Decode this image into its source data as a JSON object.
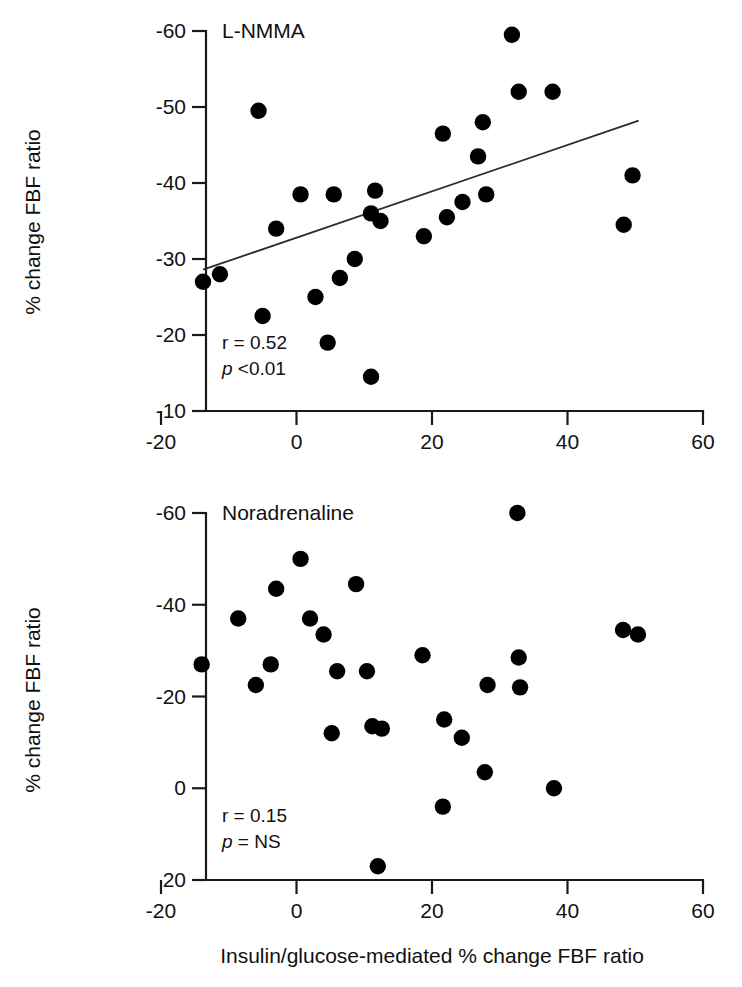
{
  "figure": {
    "x_axis_title": "Insulin/glucose-mediated % change FBF ratio",
    "y_axis_title": "% change FBF ratio"
  },
  "chart_data": [
    {
      "type": "scatter",
      "panel_id": "top",
      "title": "L-NMMA",
      "xlabel": "",
      "ylabel": "% change FBF ratio",
      "xlim": [
        -20,
        60
      ],
      "ylim": [
        -10,
        -60
      ],
      "y_axis_inverted": true,
      "xticks": [
        -20,
        0,
        20,
        40,
        60
      ],
      "yticks": [
        -60,
        -50,
        -40,
        -30,
        -20,
        -10
      ],
      "grid": false,
      "legend": "none",
      "annotations": {
        "r_label": "r = 0.52",
        "p_label": "p <0.01",
        "r_value": 0.52,
        "p_value": "<0.01"
      },
      "fit_line": {
        "visible": true,
        "x_start": -13.8,
        "y_start": -28.6,
        "x_end": 50.5,
        "y_end": -48.2
      },
      "points": [
        {
          "x": -13.8,
          "y": -27.0
        },
        {
          "x": -11.3,
          "y": -28.0
        },
        {
          "x": -5.6,
          "y": -49.5
        },
        {
          "x": -5.0,
          "y": -22.5
        },
        {
          "x": -3.0,
          "y": -34.0
        },
        {
          "x": 0.6,
          "y": -38.5
        },
        {
          "x": 2.8,
          "y": -25.0
        },
        {
          "x": 4.6,
          "y": -19.0
        },
        {
          "x": 5.5,
          "y": -38.5
        },
        {
          "x": 6.4,
          "y": -27.5
        },
        {
          "x": 8.6,
          "y": -30.0
        },
        {
          "x": 11.0,
          "y": -14.5
        },
        {
          "x": 11.0,
          "y": -36.0
        },
        {
          "x": 11.6,
          "y": -39.0
        },
        {
          "x": 12.4,
          "y": -35.0
        },
        {
          "x": 18.8,
          "y": -33.0
        },
        {
          "x": 21.6,
          "y": -46.5
        },
        {
          "x": 22.2,
          "y": -35.5
        },
        {
          "x": 24.5,
          "y": -37.5
        },
        {
          "x": 26.8,
          "y": -43.5
        },
        {
          "x": 27.5,
          "y": -48.0
        },
        {
          "x": 28.0,
          "y": -38.5
        },
        {
          "x": 31.8,
          "y": -59.5
        },
        {
          "x": 32.8,
          "y": -52.0
        },
        {
          "x": 37.8,
          "y": -52.0
        },
        {
          "x": 48.3,
          "y": -34.5
        },
        {
          "x": 49.6,
          "y": -41.0
        }
      ]
    },
    {
      "type": "scatter",
      "panel_id": "bottom",
      "title": "Noradrenaline",
      "xlabel": "Insulin/glucose-mediated % change FBF ratio",
      "ylabel": "% change FBF ratio",
      "xlim": [
        -20,
        60
      ],
      "ylim": [
        20,
        -60
      ],
      "y_axis_inverted": true,
      "xticks": [
        -20,
        0,
        20,
        40,
        60
      ],
      "yticks": [
        -60,
        -40,
        -20,
        0,
        20
      ],
      "grid": false,
      "legend": "none",
      "annotations": {
        "r_label": "r = 0.15",
        "p_label": "p = NS",
        "r_value": 0.15,
        "p_value": "NS"
      },
      "fit_line": {
        "visible": false
      },
      "points": [
        {
          "x": -14.0,
          "y": -27.0
        },
        {
          "x": -8.6,
          "y": -37.0
        },
        {
          "x": -6.0,
          "y": -22.5
        },
        {
          "x": -3.8,
          "y": -27.0
        },
        {
          "x": -3.0,
          "y": -43.5
        },
        {
          "x": 0.6,
          "y": -50.0
        },
        {
          "x": 2.0,
          "y": -37.0
        },
        {
          "x": 4.0,
          "y": -33.5
        },
        {
          "x": 5.2,
          "y": -12.0
        },
        {
          "x": 6.0,
          "y": -25.5
        },
        {
          "x": 8.8,
          "y": -44.5
        },
        {
          "x": 10.4,
          "y": -25.5
        },
        {
          "x": 11.2,
          "y": -13.5
        },
        {
          "x": 12.6,
          "y": -13.0
        },
        {
          "x": 12.0,
          "y": 17.0
        },
        {
          "x": 18.6,
          "y": -29.0
        },
        {
          "x": 21.6,
          "y": 4.0
        },
        {
          "x": 21.8,
          "y": -15.0
        },
        {
          "x": 24.4,
          "y": -11.0
        },
        {
          "x": 27.8,
          "y": -3.5
        },
        {
          "x": 28.2,
          "y": -22.5
        },
        {
          "x": 32.6,
          "y": -60.0
        },
        {
          "x": 32.8,
          "y": -28.5
        },
        {
          "x": 33.0,
          "y": -22.0
        },
        {
          "x": 38.0,
          "y": 0.0
        },
        {
          "x": 48.2,
          "y": -34.5
        },
        {
          "x": 50.4,
          "y": -33.5
        }
      ]
    }
  ]
}
